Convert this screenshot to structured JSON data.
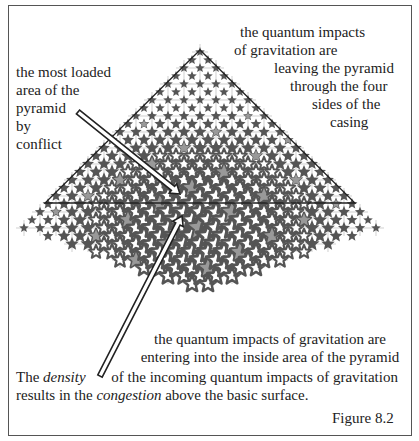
{
  "figure": {
    "label": "Figure 8.2",
    "labels": {
      "top_left": [
        "the most loaded",
        "area of the",
        "pyramid",
        "by",
        "conflict"
      ],
      "top_right": [
        "the quantum impacts",
        "of gravitation are",
        "leaving the pyramid",
        "through the four",
        "sides of the",
        "casing"
      ],
      "middle": [
        "the quantum impacts of gravitation are",
        "entering into the inside area of the pyramid"
      ],
      "bottom": {
        "line1_prefix": "The ",
        "line1_emph": "density",
        "line1_suffix": " of the incoming quantum impacts of gravitation",
        "line2_prefix": "results in the ",
        "line2_emph": "congestion",
        "line2_suffix": " above the basic surface."
      }
    },
    "colors": {
      "star_dark": "#555555",
      "star_light": "#999999",
      "core": "#666666",
      "line": "#222222",
      "grid": "#bbbbbb"
    },
    "icons": [
      "star-icon",
      "arrow-icon",
      "pyramid-triangle-icon"
    ]
  }
}
